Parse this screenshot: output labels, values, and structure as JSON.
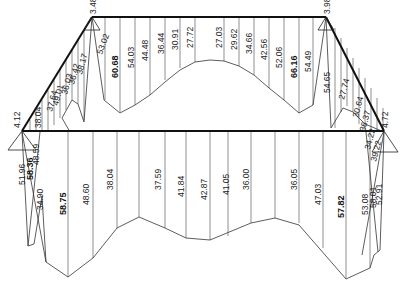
{
  "diagram": {
    "type": "structural-frame-force-diagram",
    "nodes": {
      "left_support": {
        "label": "4.12"
      },
      "top_left": {
        "label": "3.48"
      },
      "top_right": {
        "label": "3.98"
      },
      "right_support": {
        "label": "4.72"
      }
    },
    "top_beam_labels": [
      "53.02",
      "60.68",
      "54.03",
      "44.48",
      "36.44",
      "30.91",
      "27.72",
      "27.03",
      "29.62",
      "34.66",
      "42.56",
      "52.06",
      "66.16",
      "54.49"
    ],
    "bottom_beam_labels": [
      "58.75",
      "48.60",
      "38.04",
      "37.59",
      "41.84",
      "42.87",
      "41.05",
      "36.00",
      "36.05",
      "47.03",
      "57.82",
      "53.08"
    ],
    "left_slope_labels": [
      "37.64",
      "38.04",
      "49.01",
      "36.03",
      "36.42",
      "38.17"
    ],
    "right_slope_labels": [
      "54.65",
      "27.74",
      "30.64",
      "36.37",
      "34.22",
      "39.22"
    ],
    "left_leg_labels": [
      "51.96",
      "58.36",
      "48.59",
      "34.90"
    ],
    "right_leg_labels": [
      "58.01",
      "52.91"
    ],
    "colors": {
      "background": "#ffffff",
      "line": "#111111",
      "text": "#222222"
    }
  }
}
